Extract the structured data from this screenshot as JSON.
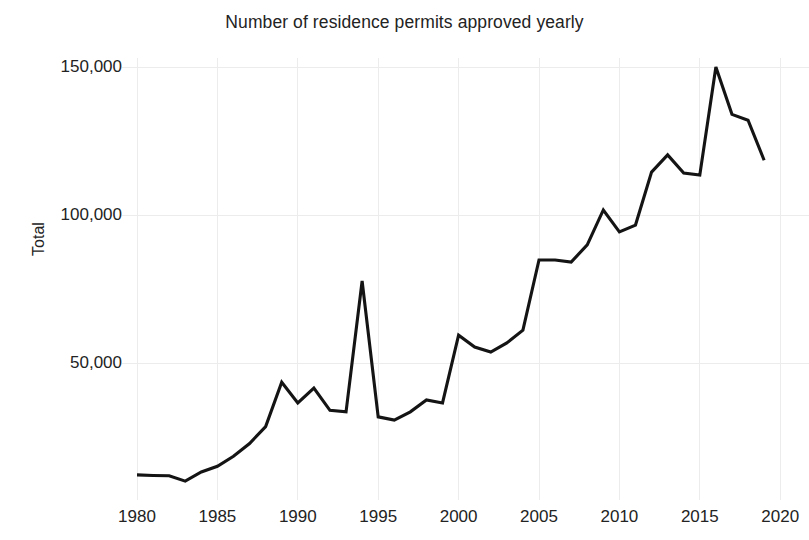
{
  "chart_data": {
    "type": "line",
    "title": "Number of residence permits approved yearly",
    "xlabel": "",
    "ylabel": "Total",
    "xlim": [
      1979,
      2020.5
    ],
    "ylim": [
      0,
      158000
    ],
    "grid": true,
    "legend": null,
    "x_ticks": [
      "1980",
      "1985",
      "1990",
      "1995",
      "2000",
      "2005",
      "2010",
      "2015",
      "2020"
    ],
    "x_tick_values": [
      1980,
      1985,
      1990,
      1995,
      2000,
      2005,
      2010,
      2015,
      2020
    ],
    "y_ticks": [
      "50,000",
      "100,000",
      "150,000"
    ],
    "y_tick_values": [
      50000,
      100000,
      150000
    ],
    "series": [
      {
        "name": "Total",
        "color": "#141414",
        "x": [
          1980,
          1981,
          1982,
          1983,
          1984,
          1985,
          1986,
          1987,
          1988,
          1989,
          1990,
          1991,
          1992,
          1993,
          1994,
          1995,
          1996,
          1997,
          1998,
          1999,
          2000,
          2001,
          2002,
          2003,
          2004,
          2005,
          2006,
          2007,
          2008,
          2009,
          2010,
          2011,
          2012,
          2013,
          2014,
          2015,
          2016,
          2017,
          2018,
          2019
        ],
        "values": [
          12200,
          12000,
          11900,
          10100,
          13200,
          15100,
          18500,
          22800,
          28500,
          43500,
          36500,
          41500,
          34000,
          33500,
          77700,
          31800,
          30700,
          33500,
          37500,
          36500,
          59400,
          55400,
          53700,
          56800,
          61100,
          84800,
          84800,
          84100,
          89900,
          101700,
          94300,
          96600,
          114500,
          120300,
          114200,
          113500,
          150000,
          134000,
          132000,
          118500
        ]
      }
    ]
  }
}
